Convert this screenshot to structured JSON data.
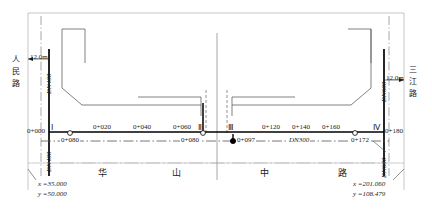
{
  "drawing": {
    "title": "华山中路 管线平面布置图",
    "road_name_chars": [
      "华",
      "山",
      "中",
      "路"
    ],
    "left_cross_road": [
      "人",
      "民",
      "路"
    ],
    "right_cross_road": [
      "三",
      "江",
      "路"
    ],
    "width_labels": {
      "left": "12.0m",
      "right": "12.0m"
    },
    "pipes": {
      "left_vertical_upper": "DN400",
      "left_vertical_lower": "DN400",
      "right_vertical_upper": "DN600",
      "right_vertical_lower": "DN600",
      "branch_center": "DN300"
    },
    "nodes": [
      "Ⅰ",
      "Ⅱ",
      "Ⅲ",
      "Ⅳ"
    ],
    "stations_main": [
      "0+000",
      "0+020",
      "0+040",
      "0+060",
      "0+120",
      "0+140",
      "0+160",
      "0+180"
    ],
    "stations_branch": [
      "0+080",
      "0+080",
      "0+097",
      "0+172"
    ],
    "coordinates": {
      "left": {
        "x": "x =35.000",
        "y": "y =50.000"
      },
      "right": {
        "x": "x =201.060",
        "y": "y =108.479"
      }
    },
    "colors": {
      "line": "#1a1a1a",
      "thin": "#555555",
      "dash": "#6b6b6b",
      "background": "#ffffff"
    }
  }
}
